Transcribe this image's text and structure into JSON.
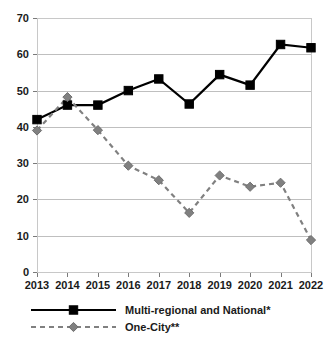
{
  "chart_data": {
    "type": "line",
    "title": "",
    "subtitle": "",
    "xlabel": "",
    "ylabel": "",
    "categories": [
      "2013",
      "2014",
      "2015",
      "2016",
      "2017",
      "2018",
      "2019",
      "2020",
      "2021",
      "2022"
    ],
    "series": [
      {
        "name": "Multi-regional and National*",
        "values": [
          42.0,
          46.0,
          46.0,
          50.0,
          53.2,
          46.3,
          54.4,
          51.5,
          62.7,
          61.8
        ],
        "color": "#000000",
        "line_style": "solid",
        "marker": "square"
      },
      {
        "name": "One-City**",
        "values": [
          39.0,
          48.2,
          39.1,
          29.3,
          25.3,
          16.3,
          26.6,
          23.5,
          24.6,
          8.8
        ],
        "color": "#808080",
        "line_style": "dashed",
        "marker": "diamond"
      }
    ],
    "ylim": [
      0,
      70
    ],
    "yticks": [
      0,
      10,
      20,
      30,
      40,
      50,
      60,
      70
    ],
    "ytick_labels": [
      "0",
      "10",
      "20",
      "30",
      "40",
      "50",
      "60",
      "70"
    ],
    "xtick_labels": [
      "2013",
      "2014",
      "2015",
      "2016",
      "2017",
      "2018",
      "2019",
      "2020",
      "2021",
      "2022"
    ],
    "grid": "horizontal",
    "legend_position": "bottom-left",
    "legend": [
      {
        "label": "Multi-regional and National*",
        "color": "#000000",
        "line_style": "solid",
        "marker": "square"
      },
      {
        "label": "One-City**",
        "color": "#808080",
        "line_style": "dashed",
        "marker": "diamond"
      }
    ]
  }
}
